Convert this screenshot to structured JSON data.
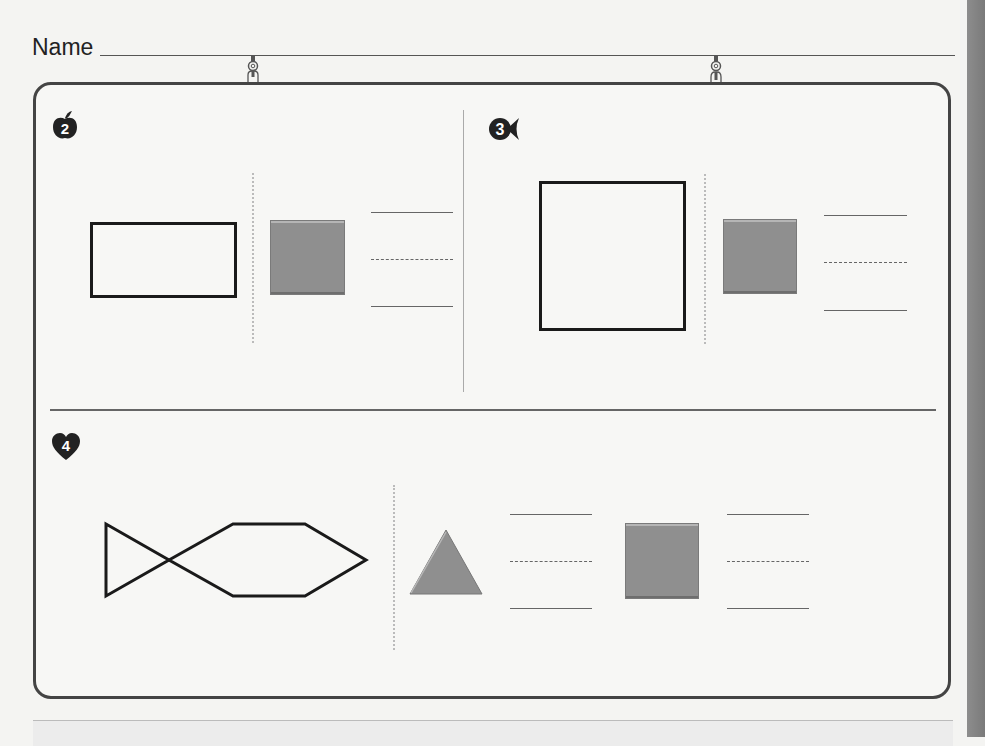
{
  "header": {
    "name_label": "Name"
  },
  "problems": [
    {
      "number": "2",
      "badge_shape": "apple",
      "figure": "rectangle-outline",
      "pieces": [
        {
          "shape": "square",
          "color": "#8f8f8f"
        }
      ],
      "answer_lines": 1
    },
    {
      "number": "3",
      "badge_shape": "fish",
      "figure": "square-outline",
      "pieces": [
        {
          "shape": "square",
          "color": "#8f8f8f"
        }
      ],
      "answer_lines": 1
    },
    {
      "number": "4",
      "badge_shape": "heart",
      "figure": "fish-outline (triangle tail + hexagon body)",
      "pieces": [
        {
          "shape": "triangle",
          "color": "#8f8f8f"
        },
        {
          "shape": "square",
          "color": "#8f8f8f"
        }
      ],
      "answer_lines": 2
    }
  ],
  "colors": {
    "outline": "#1a1a1a",
    "piece_fill": "#8f8f8f",
    "frame_border": "#444444",
    "page_bg": "#f4f4f2"
  }
}
